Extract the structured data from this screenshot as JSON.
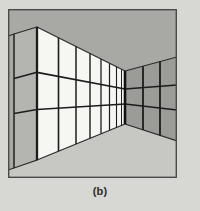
{
  "figure": {
    "caption": "(b)",
    "kind": "one-point-perspective-room-interior",
    "frame": {
      "x": 8,
      "y": 9,
      "width": 169,
      "height": 169,
      "border_color": "#4a4a4a",
      "border_width": 1.4
    },
    "canvas": {
      "width": 200,
      "height": 211,
      "page_background": "#d7d7d3"
    },
    "vanishing_point": {
      "x": 128,
      "y": 95
    },
    "colors": {
      "page_background": "#d7d7d3",
      "frame_border": "#4a4a4a",
      "ceiling": "#a8a8a5",
      "floor": "#c7c7c4",
      "left_wall_panel": "#f6f6f3",
      "left_return_panel": "#b4b4b0",
      "right_wall_panel": "#9b9b97",
      "mullion_dark": "#1c1c1c",
      "mullion_mid": "#3a3a3a",
      "edge_line": "#2a2a2a",
      "caption_text": "#2b2b2b"
    },
    "left_wall": {
      "name": "left-gridded-wall",
      "panel_fill": "#f6f6f3",
      "columns": 8,
      "rows": 3,
      "top_front_y": 27,
      "bottom_front_y": 160,
      "front_x": 37,
      "back_x": 125,
      "vertical_mullion_x": [
        37,
        58.5,
        76,
        90,
        101,
        109.5,
        116.5,
        121.5,
        125
      ],
      "horizontal_rail_fractions": [
        0.0,
        0.34,
        0.62,
        1.0
      ]
    },
    "left_return_wall": {
      "name": "left-return-wall",
      "panel_fill": "#b4b4b0",
      "front_x": 14,
      "corner_x": 37,
      "top_front_y": 34,
      "top_corner_y": 27,
      "bottom_front_y": 168,
      "bottom_corner_y": 160,
      "rows": 3
    },
    "right_wall": {
      "name": "right-gridded-wall",
      "panel_fill": "#9b9b97",
      "columns": 3,
      "rows": 3,
      "corner_x": 125,
      "edge_x": 177,
      "corner_top_y": 71,
      "corner_bottom_y": 124,
      "edge_top_y": 57,
      "edge_bottom_y": 141,
      "vertical_mullion_x": [
        125,
        143,
        160,
        177
      ]
    },
    "ceiling": {
      "name": "ceiling-plane",
      "fill": "#a8a8a5"
    },
    "floor": {
      "name": "floor-plane",
      "fill": "#c7c7c4"
    }
  }
}
